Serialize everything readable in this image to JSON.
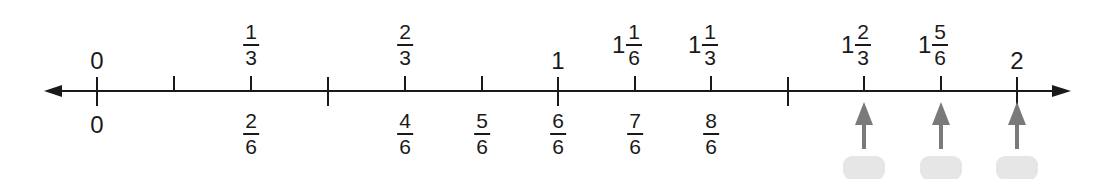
{
  "number_line": {
    "range": [
      0,
      2
    ],
    "arrow_heads": "both",
    "line_color": "#1a1a1a",
    "ticks": [
      {
        "value": "0",
        "x": 97,
        "major": true
      },
      {
        "value": "1/6",
        "x": 174,
        "major": false
      },
      {
        "value": "2/6",
        "x": 251,
        "major": false
      },
      {
        "value": "3/6",
        "x": 328,
        "major": true
      },
      {
        "value": "4/6",
        "x": 405,
        "major": false
      },
      {
        "value": "5/6",
        "x": 482,
        "major": false
      },
      {
        "value": "1",
        "x": 558,
        "major": true
      },
      {
        "value": "7/6",
        "x": 635,
        "major": false
      },
      {
        "value": "8/6",
        "x": 711,
        "major": false
      },
      {
        "value": "9/6",
        "x": 788,
        "major": true
      },
      {
        "value": "10/6",
        "x": 864,
        "major": false
      },
      {
        "value": "11/6",
        "x": 941,
        "major": false
      },
      {
        "value": "2",
        "x": 1017,
        "major": true
      }
    ]
  },
  "top_labels": [
    {
      "x": 97,
      "type": "whole",
      "whole": "0"
    },
    {
      "x": 251,
      "type": "frac",
      "num": "1",
      "den": "3"
    },
    {
      "x": 405,
      "type": "frac",
      "num": "2",
      "den": "3"
    },
    {
      "x": 558,
      "type": "whole",
      "whole": "1"
    },
    {
      "x": 635,
      "type": "mixed",
      "whole": "1",
      "num": "1",
      "den": "6"
    },
    {
      "x": 711,
      "type": "mixed",
      "whole": "1",
      "num": "1",
      "den": "3"
    },
    {
      "x": 864,
      "type": "mixed",
      "whole": "1",
      "num": "2",
      "den": "3"
    },
    {
      "x": 941,
      "type": "mixed",
      "whole": "1",
      "num": "5",
      "den": "6"
    },
    {
      "x": 1017,
      "type": "whole",
      "whole": "2"
    }
  ],
  "bottom_labels": [
    {
      "x": 97,
      "type": "whole",
      "whole": "0"
    },
    {
      "x": 251,
      "type": "frac",
      "num": "2",
      "den": "6"
    },
    {
      "x": 405,
      "type": "frac",
      "num": "4",
      "den": "6"
    },
    {
      "x": 482,
      "type": "frac",
      "num": "5",
      "den": "6"
    },
    {
      "x": 558,
      "type": "frac",
      "num": "6",
      "den": "6"
    },
    {
      "x": 635,
      "type": "frac",
      "num": "7",
      "den": "6"
    },
    {
      "x": 711,
      "type": "frac",
      "num": "8",
      "den": "6"
    },
    {
      "x": 864,
      "type": "blank"
    },
    {
      "x": 941,
      "type": "blank"
    },
    {
      "x": 1017,
      "type": "blank"
    }
  ],
  "pointer_arrows": {
    "color": "#7a7a7a",
    "box_color": "#e6e6e6",
    "xs": [
      864,
      941,
      1017
    ]
  }
}
